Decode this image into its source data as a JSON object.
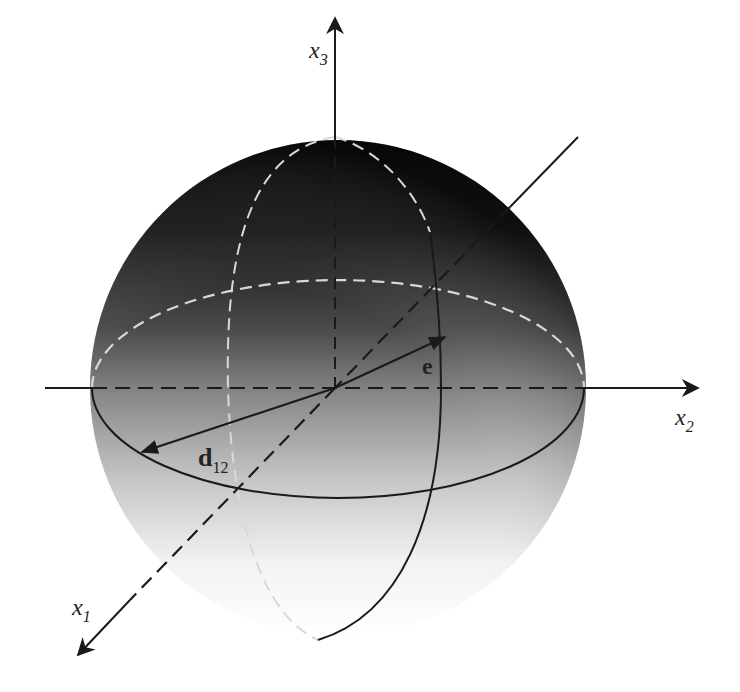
{
  "figure": {
    "axes": {
      "x1": {
        "name": "x",
        "sub": "1"
      },
      "x2": {
        "name": "x",
        "sub": "2"
      },
      "x3": {
        "name": "x",
        "sub": "3"
      }
    },
    "vectors": {
      "e": {
        "name": "e"
      },
      "d12": {
        "name": "d",
        "sub": "12"
      }
    },
    "colors": {
      "sphere_top": "#0c0c0c",
      "sphere_mid": "#7a7a7a",
      "sphere_bottom": "#ffffff",
      "line": "#1a1a1a",
      "hidden_line": "#d8d8d8"
    }
  }
}
